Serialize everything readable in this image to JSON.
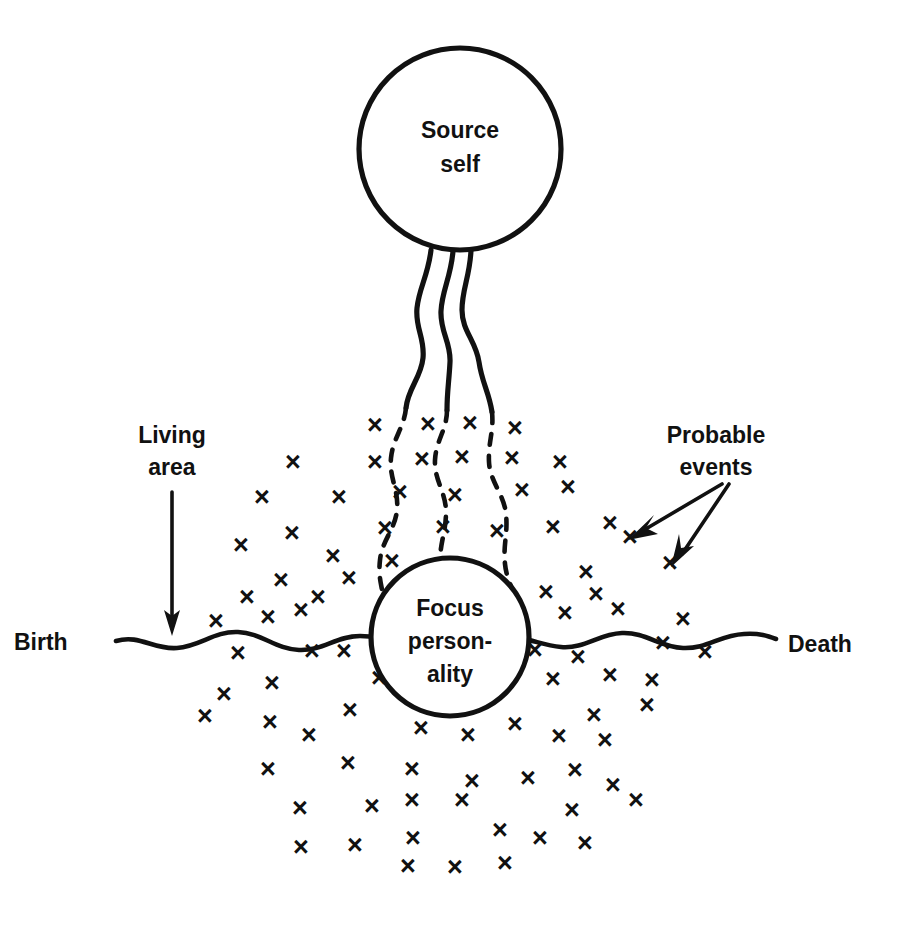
{
  "diagram": {
    "title_text": "",
    "colors": {
      "ink": "#111111",
      "background": "#ffffff"
    },
    "nodes": [
      {
        "id": "source-self",
        "label_line1": "Source",
        "label_line2": "self",
        "shape": "circle",
        "cx": 460,
        "cy": 149,
        "r": 101
      },
      {
        "id": "focus-personality",
        "label_line1": "Focus",
        "label_line2": "person-",
        "label_line3": "ality",
        "shape": "circle",
        "cx": 450,
        "cy": 637,
        "r": 79
      }
    ],
    "labels": {
      "living_area_line1": "Living",
      "living_area_line2": "area",
      "birth": "Birth",
      "death": "Death",
      "probable_events_line1": "Probable",
      "probable_events_line2": "events"
    },
    "x_mark_glyph": "×",
    "annotations": {
      "living_area_arrow": "arrow-down",
      "probable_events_arrow_1": "arrow-down-left",
      "probable_events_arrow_2": "arrow-down-left"
    },
    "connector_note": "three wavy cords from source self become dashed as they enter the probable-event cloud and reach the focus personality"
  },
  "chart_data": {
    "type": "scatter",
    "xlabel": "",
    "ylabel": "",
    "series": [
      {
        "name": "probable events",
        "marker": "x",
        "points": [
          [
            375,
            425
          ],
          [
            428,
            424
          ],
          [
            470,
            423
          ],
          [
            515,
            428
          ],
          [
            293,
            462
          ],
          [
            375,
            462
          ],
          [
            422,
            459
          ],
          [
            462,
            457
          ],
          [
            512,
            458
          ],
          [
            560,
            462
          ],
          [
            262,
            497
          ],
          [
            339,
            497
          ],
          [
            400,
            492
          ],
          [
            455,
            495
          ],
          [
            522,
            490
          ],
          [
            568,
            487
          ],
          [
            292,
            533
          ],
          [
            385,
            528
          ],
          [
            443,
            527
          ],
          [
            497,
            531
          ],
          [
            553,
            527
          ],
          [
            610,
            523
          ],
          [
            241,
            545
          ],
          [
            333,
            556
          ],
          [
            392,
            561
          ],
          [
            630,
            537
          ],
          [
            281,
            580
          ],
          [
            349,
            578
          ],
          [
            586,
            572
          ],
          [
            670,
            563
          ],
          [
            247,
            597
          ],
          [
            318,
            597
          ],
          [
            546,
            592
          ],
          [
            596,
            594
          ],
          [
            216,
            621
          ],
          [
            268,
            617
          ],
          [
            301,
            610
          ],
          [
            390,
            613
          ],
          [
            565,
            613
          ],
          [
            618,
            609
          ],
          [
            683,
            619
          ],
          [
            238,
            653
          ],
          [
            312,
            651
          ],
          [
            344,
            651
          ],
          [
            400,
            657
          ],
          [
            535,
            650
          ],
          [
            578,
            657
          ],
          [
            663,
            643
          ],
          [
            705,
            652
          ],
          [
            272,
            683
          ],
          [
            379,
            678
          ],
          [
            424,
            677
          ],
          [
            499,
            682
          ],
          [
            553,
            679
          ],
          [
            474,
            689
          ],
          [
            610,
            675
          ],
          [
            652,
            680
          ],
          [
            224,
            694
          ],
          [
            270,
            722
          ],
          [
            350,
            710
          ],
          [
            594,
            715
          ],
          [
            647,
            705
          ],
          [
            205,
            716
          ],
          [
            309,
            735
          ],
          [
            421,
            728
          ],
          [
            468,
            735
          ],
          [
            515,
            724
          ],
          [
            559,
            736
          ],
          [
            605,
            740
          ],
          [
            268,
            769
          ],
          [
            348,
            763
          ],
          [
            412,
            769
          ],
          [
            472,
            781
          ],
          [
            528,
            778
          ],
          [
            575,
            770
          ],
          [
            613,
            785
          ],
          [
            300,
            808
          ],
          [
            372,
            806
          ],
          [
            412,
            800
          ],
          [
            462,
            800
          ],
          [
            572,
            810
          ],
          [
            636,
            800
          ],
          [
            301,
            847
          ],
          [
            355,
            845
          ],
          [
            413,
            838
          ],
          [
            500,
            830
          ],
          [
            540,
            838
          ],
          [
            585,
            843
          ],
          [
            408,
            866
          ],
          [
            455,
            867
          ],
          [
            505,
            863
          ]
        ]
      }
    ],
    "annotations": [
      {
        "text": "Living area",
        "x": 172,
        "y": 450
      },
      {
        "text": "Birth",
        "x": 57,
        "y": 640
      },
      {
        "text": "Death",
        "x": 822,
        "y": 642
      },
      {
        "text": "Probable events",
        "x": 716,
        "y": 450
      }
    ],
    "grid": false,
    "legend": "none"
  }
}
